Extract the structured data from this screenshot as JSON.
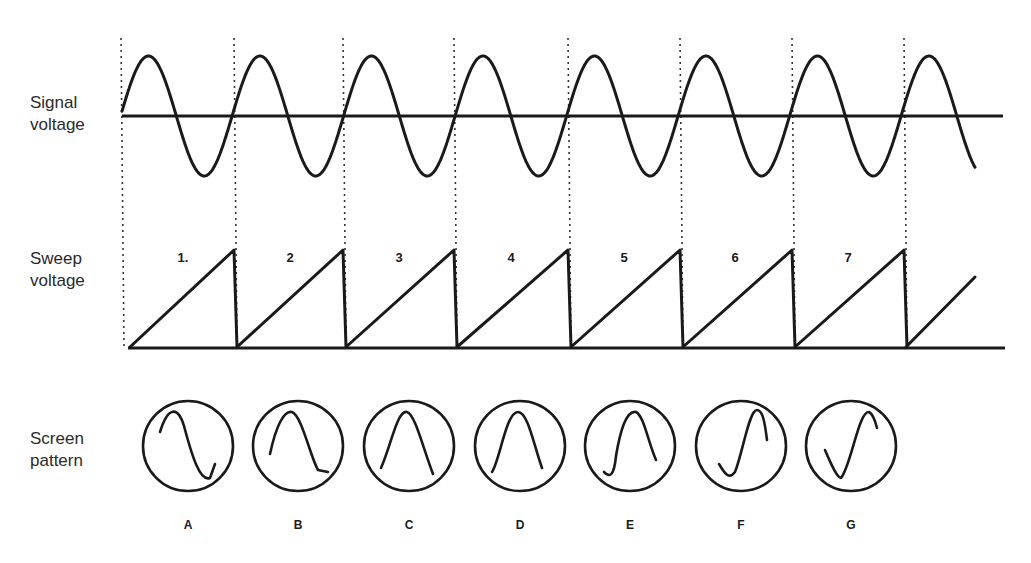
{
  "labels": {
    "signal": [
      "Signal",
      "voltage"
    ],
    "sweep": [
      "Sweep",
      "voltage"
    ],
    "screen": [
      "Screen",
      "pattern"
    ]
  },
  "sweep_numbers": [
    "1.",
    "2",
    "3",
    "4",
    "5",
    "6",
    "7"
  ],
  "screen_letters": [
    "A",
    "B",
    "C",
    "D",
    "E",
    "F",
    "G"
  ],
  "geometry": {
    "sync_lines_x": [
      121,
      234,
      343,
      454,
      568,
      680,
      792,
      904
    ],
    "sweep_number_x": [
      183,
      290,
      399,
      511,
      624,
      735,
      848
    ],
    "screen_centers_x": [
      188,
      298,
      409,
      520,
      630,
      741,
      851
    ],
    "screen_center_y": 446,
    "screen_radius": 45
  },
  "chart_data": {
    "type": "line",
    "title": "",
    "series": [
      {
        "name": "Signal voltage",
        "shape": "sine",
        "cycles_shown": 7.5,
        "baseline_y_px": 116,
        "amplitude_px": 60,
        "x_start_px": 122,
        "x_end_px": 975
      },
      {
        "name": "Sweep voltage",
        "shape": "sawtooth",
        "teeth": 7,
        "tooth_end_x_px": [
          234,
          343,
          454,
          568,
          680,
          792,
          904
        ],
        "baseline_y_px": 347,
        "peak_y_px": 250,
        "partial_final_ramp": true
      }
    ],
    "screen_patterns": [
      {
        "label": "A",
        "description": "full sine from peak to trough"
      },
      {
        "label": "B",
        "description": "sine shifted — peak then trough"
      },
      {
        "label": "C",
        "description": "single hump (peak centered)"
      },
      {
        "label": "D",
        "description": "single hump, slightly shifted"
      },
      {
        "label": "E",
        "description": "hump with trough tail on left"
      },
      {
        "label": "F",
        "description": "rising S from trough to peak"
      },
      {
        "label": "G",
        "description": "trough then rise to peak"
      }
    ]
  }
}
